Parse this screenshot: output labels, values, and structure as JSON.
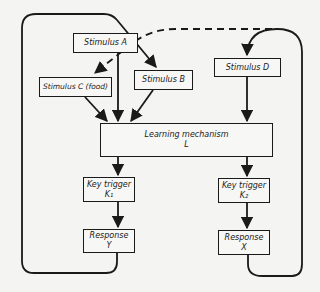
{
  "diagram": {
    "nodes": {
      "stimulus_a": {
        "label": "Stimulus A"
      },
      "stimulus_b": {
        "label": "Stimulus B"
      },
      "stimulus_c": {
        "label": "Stimulus C (food)"
      },
      "stimulus_d": {
        "label": "Stimulus D"
      },
      "learning": {
        "label": "Learning mechanism",
        "symbol": "L"
      },
      "key_trigger_1": {
        "label": "Key trigger",
        "symbol": "K₁"
      },
      "key_trigger_2": {
        "label": "Key trigger",
        "symbol": "K₂"
      },
      "response_y": {
        "label": "Response",
        "symbol": "Y"
      },
      "response_x": {
        "label": "Response",
        "symbol": "X"
      }
    },
    "edges": [
      {
        "from": "stimulus_a",
        "to": "learning",
        "style": "solid"
      },
      {
        "from": "stimulus_b",
        "to": "learning",
        "style": "solid"
      },
      {
        "from": "stimulus_c",
        "to": "learning",
        "style": "solid"
      },
      {
        "from": "stimulus_d",
        "to": "learning",
        "style": "solid"
      },
      {
        "from": "learning",
        "to": "key_trigger_1",
        "style": "solid"
      },
      {
        "from": "learning",
        "to": "key_trigger_2",
        "style": "solid"
      },
      {
        "from": "key_trigger_1",
        "to": "response_y",
        "style": "solid"
      },
      {
        "from": "key_trigger_2",
        "to": "response_x",
        "style": "solid"
      },
      {
        "from": "response_y",
        "to": "stimulus_b",
        "style": "solid-loop"
      },
      {
        "from": "response_x",
        "to": "stimulus_d",
        "style": "solid-loop"
      },
      {
        "from": "stimulus_d-loop",
        "to": "stimulus_c",
        "style": "dashed"
      }
    ],
    "colors": {
      "line": "#1a1a1a",
      "background": "#f4f4f2"
    }
  }
}
